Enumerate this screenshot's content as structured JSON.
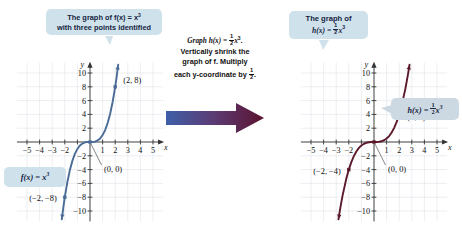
{
  "figure": {
    "callout_left": {
      "line1": "The graph of f(x) = x",
      "line1_exp": "3",
      "line2": "with three points identified"
    },
    "callout_right": {
      "line1": "The graph of",
      "line2_lhs": "h(x) = ",
      "line2_frac_num": "1",
      "line2_frac_den": "2",
      "line2_var": "x",
      "line2_exp": "3"
    },
    "instruction": {
      "line1_a": "Graph h(x) = ",
      "line1_num": "1",
      "line1_den": "2",
      "line1_b": "x",
      "line1_exp": "3",
      "line1_c": ".",
      "line2": "Vertically shrink the",
      "line3": "graph of f. Multiply",
      "line4_a": "each y-coordinate by ",
      "line4_num": "1",
      "line4_den": "2",
      "line4_b": "."
    },
    "arrow": {
      "name": "transform-arrow",
      "gradient_start": "#3f5fa8",
      "gradient_end": "#5b1230"
    },
    "tag_left": {
      "lhs": "f(x) = x",
      "exp": "3"
    },
    "tag_right": {
      "lhs": "h(x) = ",
      "num": "1",
      "den": "2",
      "var": "x",
      "exp": "3"
    }
  },
  "chart_data": [
    {
      "id": "left",
      "type": "line",
      "title": "f(x) = x^3",
      "function": "f(x) = x^3",
      "curve_color": "#4a6c96",
      "xlabel": "x",
      "ylabel": "y",
      "xlim": [
        -5.8,
        5.8
      ],
      "ylim": [
        -11.5,
        11.5
      ],
      "xticks": [
        -5,
        -4,
        -3,
        -2,
        -1,
        1,
        2,
        3,
        4,
        5
      ],
      "xtick_labels": [
        "-5",
        "-4",
        "-3",
        "-2",
        "",
        "1",
        "2",
        "3",
        "4",
        "5"
      ],
      "yticks": [
        -10,
        -8,
        -6,
        -4,
        -2,
        2,
        4,
        6,
        8,
        10
      ],
      "ytick_labels": [
        "-10",
        "-8",
        "-6",
        "-4",
        "-2",
        "2",
        "4",
        "6",
        "8",
        "10"
      ],
      "grid": true,
      "grid_color": "#dfe3e8",
      "points": [
        {
          "label": "(2, 8)",
          "x": 2,
          "y": 8
        },
        {
          "label": "(0, 0)",
          "x": 0,
          "y": 0
        },
        {
          "label": "(-2, -8)",
          "x": -2,
          "y": -8
        }
      ],
      "x": [
        -2.24,
        -2.1,
        -2.0,
        -1.8,
        -1.6,
        -1.4,
        -1.2,
        -1.0,
        -0.8,
        -0.6,
        -0.4,
        -0.2,
        0,
        0.2,
        0.4,
        0.6,
        0.8,
        1.0,
        1.2,
        1.4,
        1.6,
        1.8,
        2.0,
        2.1,
        2.24
      ],
      "y": [
        -11.2,
        -9.26,
        -8.0,
        -5.83,
        -4.1,
        -2.74,
        -1.73,
        -1.0,
        -0.51,
        -0.22,
        -0.06,
        -0.01,
        0,
        0.01,
        0.06,
        0.22,
        0.51,
        1.0,
        1.73,
        2.74,
        4.1,
        5.83,
        8.0,
        9.26,
        11.2
      ]
    },
    {
      "id": "right",
      "type": "line",
      "title": "h(x) = 1/2 x^3",
      "function": "h(x) = (1/2)x^3",
      "curve_color": "#5b1a2b",
      "xlabel": "x",
      "ylabel": "y",
      "xlim": [
        -5.8,
        5.8
      ],
      "ylim": [
        -11.5,
        11.5
      ],
      "xticks": [
        -5,
        -4,
        -3,
        -2,
        -1,
        1,
        2,
        3,
        4,
        5
      ],
      "xtick_labels": [
        "-5",
        "-4",
        "-3",
        "-2",
        "",
        "1",
        "2",
        "3",
        "4",
        "5"
      ],
      "yticks": [
        -10,
        -8,
        -6,
        -4,
        -2,
        2,
        4,
        6,
        8,
        10
      ],
      "ytick_labels": [
        "-10",
        "-8",
        "-6",
        "-4",
        "-2",
        "2",
        "4",
        "6",
        "8",
        "10"
      ],
      "grid": true,
      "grid_color": "#dfe3e8",
      "points": [
        {
          "label": "(2, 4)",
          "x": 2,
          "y": 4
        },
        {
          "label": "(0, 0)",
          "x": 0,
          "y": 0
        },
        {
          "label": "(-2, -4)",
          "x": -2,
          "y": -4
        }
      ],
      "x": [
        -2.82,
        -2.7,
        -2.5,
        -2.2,
        -2.0,
        -1.8,
        -1.6,
        -1.4,
        -1.2,
        -1.0,
        -0.8,
        -0.6,
        -0.4,
        -0.2,
        0,
        0.2,
        0.4,
        0.6,
        0.8,
        1.0,
        1.2,
        1.4,
        1.6,
        1.8,
        2.0,
        2.2,
        2.5,
        2.7,
        2.82
      ],
      "y": [
        -11.2,
        -9.84,
        -7.81,
        -5.32,
        -4.0,
        -2.92,
        -2.05,
        -1.37,
        -0.86,
        -0.5,
        -0.26,
        -0.11,
        -0.03,
        -0.004,
        0,
        0.004,
        0.03,
        0.11,
        0.26,
        0.5,
        0.86,
        1.37,
        2.05,
        2.92,
        4.0,
        5.32,
        7.81,
        9.84,
        11.2
      ]
    }
  ]
}
